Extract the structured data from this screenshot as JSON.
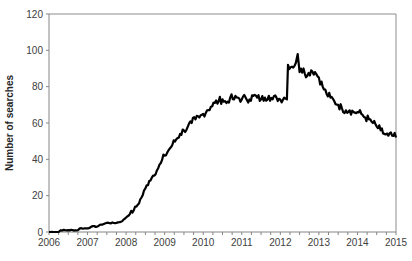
{
  "chart_data": {
    "type": "line",
    "title": "",
    "xlabel": "",
    "ylabel": "Number of searches",
    "xlim": [
      2006,
      2015
    ],
    "ylim": [
      0,
      120
    ],
    "grid": false,
    "legend": null,
    "x_ticks": [
      "2006",
      "2007",
      "2008",
      "2009",
      "2010",
      "2011",
      "2012",
      "2013",
      "2014",
      "2015"
    ],
    "y_ticks": [
      "0",
      "20",
      "40",
      "60",
      "80",
      "100",
      "120"
    ],
    "series": [
      {
        "name": "Number of searches",
        "color": "#000000",
        "x": [
          2006.0,
          2006.25,
          2006.3,
          2006.5,
          2006.75,
          2006.8,
          2007.0,
          2007.1,
          2007.25,
          2007.35,
          2007.5,
          2007.75,
          2007.9,
          2008.0,
          2008.1,
          2008.2,
          2008.3,
          2008.4,
          2008.5,
          2008.6,
          2008.7,
          2008.8,
          2008.9,
          2009.0,
          2009.1,
          2009.2,
          2009.3,
          2009.4,
          2009.5,
          2009.6,
          2009.7,
          2009.8,
          2009.9,
          2010.0,
          2010.1,
          2010.2,
          2010.3,
          2010.4,
          2010.5,
          2010.6,
          2010.7,
          2010.8,
          2010.9,
          2011.0,
          2011.1,
          2011.2,
          2011.3,
          2011.4,
          2011.5,
          2011.6,
          2011.7,
          2011.8,
          2011.9,
          2012.0,
          2012.1,
          2012.17,
          2012.2,
          2012.3,
          2012.4,
          2012.45,
          2012.5,
          2012.6,
          2012.7,
          2012.8,
          2012.9,
          2013.0,
          2013.1,
          2013.2,
          2013.3,
          2013.4,
          2013.5,
          2013.6,
          2013.7,
          2013.8,
          2013.9,
          2014.0,
          2014.1,
          2014.2,
          2014.3,
          2014.4,
          2014.5,
          2014.6,
          2014.7,
          2014.8,
          2014.9,
          2015.0
        ],
        "values": [
          0,
          0,
          1,
          1,
          1,
          2,
          2,
          3,
          3,
          4,
          5,
          5,
          6,
          8,
          10,
          12,
          15,
          19,
          24,
          28,
          31,
          34,
          38,
          42,
          45,
          48,
          51,
          54,
          56,
          58,
          60,
          62,
          63,
          65,
          67,
          69,
          71,
          72,
          73,
          71,
          74,
          73,
          74,
          73,
          74,
          73,
          75,
          74,
          73,
          74,
          75,
          73,
          74,
          73,
          74,
          73,
          92,
          91,
          93,
          98,
          88,
          90,
          86,
          89,
          88,
          85,
          80,
          76,
          74,
          72,
          70,
          68,
          67,
          67,
          66,
          66,
          65,
          63,
          62,
          60,
          58,
          56,
          54,
          53,
          53,
          52
        ]
      }
    ]
  },
  "axis": {
    "ylabel": "Number of searches"
  }
}
